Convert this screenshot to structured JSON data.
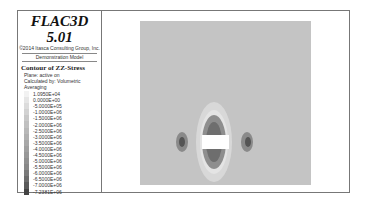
{
  "legend": {
    "app_title": "FLAC3D 5.01",
    "copyright": "©2014 Itasca Consulting Group, Inc.",
    "model_name": "Demonstration Model",
    "contour_title": "Contour of ZZ-Stress",
    "plane": "Plane: active on",
    "calculated_by": "Calculated by: Volumetric Averaging",
    "scale": [
      {
        "label": "1.0950E+04",
        "color": "#f2f2f2"
      },
      {
        "label": "0.0000E+00",
        "color": "#e6e6e6"
      },
      {
        "label": "-5.0000E+05",
        "color": "#dcdcdc"
      },
      {
        "label": "-1.0000E+06",
        "color": "#d2d2d2"
      },
      {
        "label": "-1.5000E+06",
        "color": "#c8c8c8"
      },
      {
        "label": "-2.0000E+06",
        "color": "#c0c0c0"
      },
      {
        "label": "-2.5000E+06",
        "color": "#b8b8b8"
      },
      {
        "label": "-3.0000E+06",
        "color": "#b0b0b0"
      },
      {
        "label": "-3.5000E+06",
        "color": "#a8a8a8"
      },
      {
        "label": "-4.0000E+06",
        "color": "#a0a0a0"
      },
      {
        "label": "-4.5000E+06",
        "color": "#989898"
      },
      {
        "label": "-5.0000E+06",
        "color": "#909090"
      },
      {
        "label": "-5.5000E+06",
        "color": "#888888"
      },
      {
        "label": "-6.0000E+06",
        "color": "#7a7a7a"
      },
      {
        "label": "-6.5000E+06",
        "color": "#6c6c6c"
      },
      {
        "label": "-7.0000E+06",
        "color": "#5a5a5a"
      },
      {
        "label": "-7.2381E+06",
        "color": "#444444"
      }
    ]
  },
  "plot": {
    "background_color": "#c4c4c4",
    "opening_color": "#ffffff"
  }
}
